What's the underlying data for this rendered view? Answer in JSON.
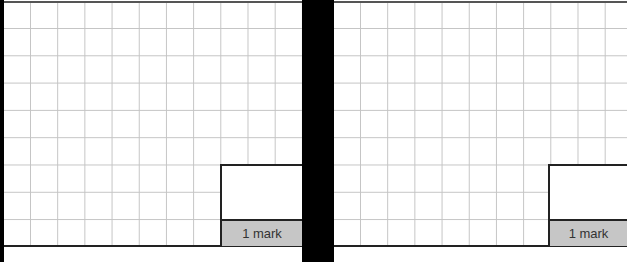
{
  "panels": [
    {
      "id": "left",
      "grid": {
        "columns": 11,
        "rows": 9
      },
      "mark_box": {
        "label": "1 mark"
      }
    },
    {
      "id": "right",
      "grid": {
        "columns": 11,
        "rows": 9
      },
      "mark_box": {
        "label": "1 mark"
      }
    }
  ],
  "colors": {
    "divider": "#000000",
    "grid_line": "#c4c4c4",
    "border": "#222222",
    "mark_label_bg": "#c6c6c6"
  }
}
